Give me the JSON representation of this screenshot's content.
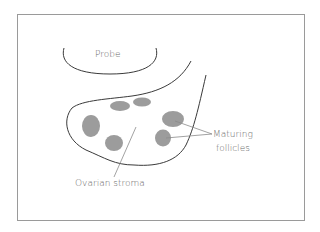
{
  "diagram": {
    "type": "ultrasound-schematic",
    "frame": {
      "stroke": "#9a9a9a"
    },
    "colors": {
      "outline": "#3a3a3a",
      "follicle": "#9c9c9c",
      "leader": "#8a8a8a",
      "text": "#6a6a6a"
    },
    "labels": {
      "probe": "Probe",
      "stroma": "Ovarian stroma",
      "follicles_line1": "Maturing",
      "follicles_line2": "follicles"
    },
    "follicles": [
      {
        "cx": 120,
        "cy": 106,
        "rx": 10,
        "ry": 5
      },
      {
        "cx": 142,
        "cy": 102,
        "rx": 9,
        "ry": 4.5
      },
      {
        "cx": 91,
        "cy": 126,
        "rx": 9,
        "ry": 11
      },
      {
        "cx": 114,
        "cy": 143,
        "rx": 9,
        "ry": 8
      },
      {
        "cx": 173,
        "cy": 119,
        "rx": 11,
        "ry": 8
      },
      {
        "cx": 163,
        "cy": 138,
        "rx": 8,
        "ry": 8.5
      }
    ]
  }
}
